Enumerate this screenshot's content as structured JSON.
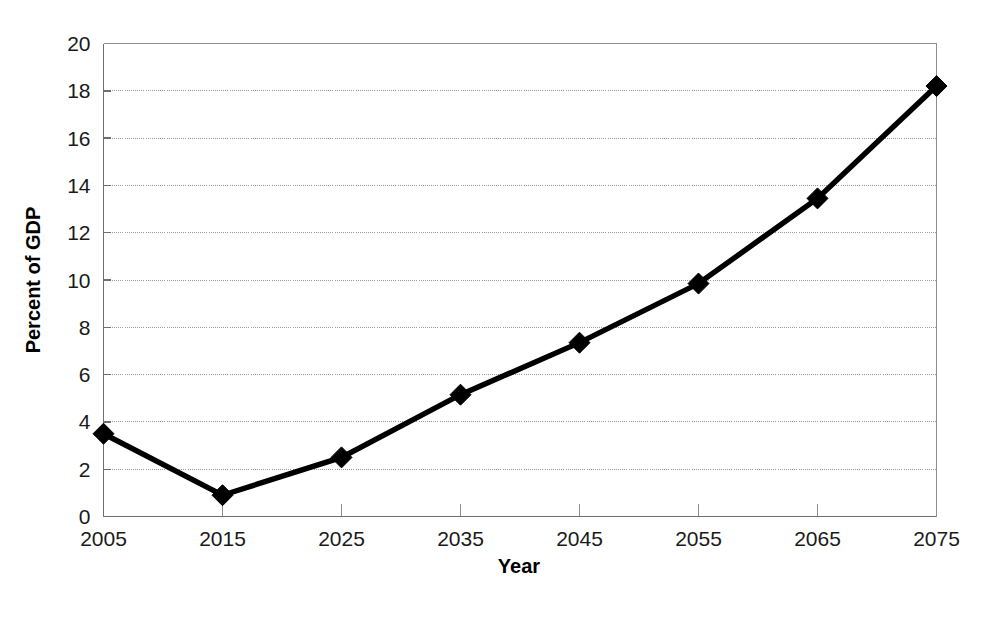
{
  "chart_data": {
    "type": "line",
    "title": "",
    "xlabel": "Year",
    "ylabel": "Percent of GDP",
    "categories": [
      2005,
      2015,
      2025,
      2035,
      2045,
      2055,
      2065,
      2075
    ],
    "x": [
      2005,
      2015,
      2025,
      2035,
      2045,
      2055,
      2065,
      2075
    ],
    "values": [
      3.5,
      0.9,
      2.5,
      5.15,
      7.35,
      9.85,
      13.45,
      18.2
    ],
    "series": [
      {
        "name": "Percent of GDP",
        "values": [
          3.5,
          0.9,
          2.5,
          5.15,
          7.35,
          9.85,
          13.45,
          18.2
        ]
      }
    ],
    "xlim": [
      2005,
      2075
    ],
    "ylim": [
      0,
      20
    ],
    "xticks": [
      "2005",
      "2015",
      "2025",
      "2035",
      "2045",
      "2055",
      "2065",
      "2075"
    ],
    "yticks": [
      "0",
      "2",
      "4",
      "6",
      "8",
      "10",
      "12",
      "14",
      "16",
      "18",
      "20"
    ],
    "ytick_values": [
      0,
      2,
      4,
      6,
      8,
      10,
      12,
      14,
      16,
      18,
      20
    ],
    "grid": "horizontal-dotted",
    "legend": "none",
    "marker": "diamond",
    "line_color": "#000000",
    "grid_color": "#9a9a9a",
    "axis_color": "#6e6e6e",
    "background": "#ffffff"
  }
}
